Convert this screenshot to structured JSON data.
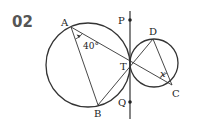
{
  "problem": {
    "number": "02"
  },
  "diagram": {
    "points": {
      "A": "A",
      "B": "B",
      "T": "T",
      "D": "D",
      "C": "C",
      "P": "P",
      "Q": "Q"
    },
    "angle_A": "40°",
    "angle_C": "x",
    "colors": {
      "stroke": "#333333",
      "text": "#222222",
      "number": "#555555"
    }
  }
}
